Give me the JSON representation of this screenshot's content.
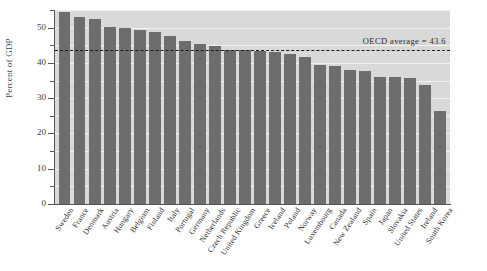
{
  "chart_data": {
    "type": "bar",
    "title": "",
    "xlabel": "",
    "ylabel": "Percent of GDP",
    "ylim": [
      0,
      55
    ],
    "yticks": [
      0,
      10,
      20,
      30,
      40,
      50
    ],
    "ytick_labels": [
      "0",
      "10",
      "20",
      "30",
      "40",
      "50"
    ],
    "minor_yticks": [
      5,
      15,
      25,
      35,
      45,
      55
    ],
    "grid": true,
    "grid_axis": "y",
    "legend": "none",
    "categories": [
      "Sweden",
      "France",
      "Denmark",
      "Austria",
      "Hungary",
      "Belgium",
      "Finland",
      "Italy",
      "Portugal",
      "Germany",
      "Netherlands",
      "Czech Republic",
      "United Kingdom",
      "Greece",
      "Iceland",
      "Poland",
      "Norway",
      "Luxembourg",
      "Canada",
      "New Zealand",
      "Spain",
      "Japan",
      "Slovakia",
      "United States",
      "Ireland",
      "South Korea"
    ],
    "values": [
      54.5,
      52.9,
      52.5,
      50.3,
      49.9,
      49.3,
      48.7,
      47.6,
      46.1,
      45.3,
      44.8,
      43.7,
      43.6,
      43.5,
      43.0,
      42.6,
      41.8,
      39.3,
      39.0,
      38.0,
      37.8,
      36.0,
      35.9,
      35.8,
      33.7,
      26.5
    ],
    "annotations": [
      {
        "name": "oecd-average",
        "label": "OECD average = 43.6",
        "value": 43.6,
        "style": "dashed-horizontal-line",
        "color": "#1a1a1a"
      }
    ],
    "colors": {
      "bar": "#6e6d6d",
      "plot_background": "#d9d9d7",
      "gridline": "#f2f2f0",
      "axis": "#555555",
      "figure_background": "#ffffff"
    }
  }
}
